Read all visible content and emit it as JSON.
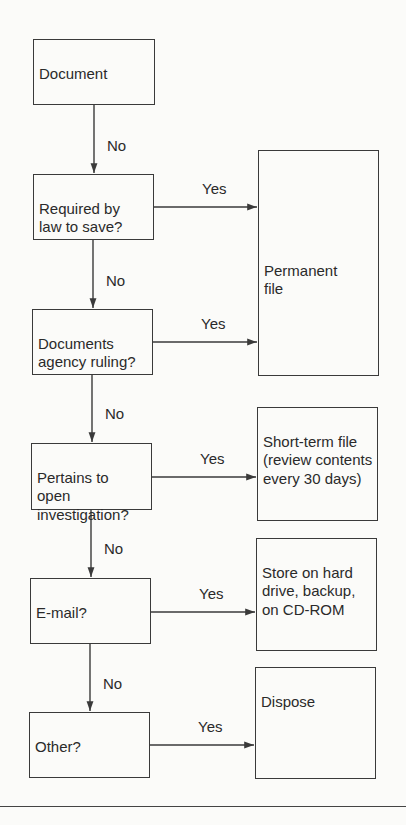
{
  "diagram": {
    "colors": {
      "line": "#3a3a3a",
      "text": "#2a2a2a",
      "background": "#fbfbf9"
    },
    "decisions": [
      {
        "id": "document",
        "label": "Document"
      },
      {
        "id": "required-by-law",
        "label": "Required by\nlaw to save?"
      },
      {
        "id": "agency-ruling",
        "label": "Documents\nagency ruling?"
      },
      {
        "id": "open-investigation",
        "label": "Pertains to\nopen\ninvestigation?"
      },
      {
        "id": "email",
        "label": "E-mail?"
      },
      {
        "id": "other",
        "label": "Other?"
      }
    ],
    "outcomes": [
      {
        "id": "permanent-file",
        "label": "Permanent\nfile"
      },
      {
        "id": "short-term-file",
        "label": "Short-term file\n(review contents\nevery 30 days)"
      },
      {
        "id": "store-digital",
        "label": "Store on hard\ndrive, backup,\non CD-ROM"
      },
      {
        "id": "dispose",
        "label": "Dispose"
      }
    ],
    "edge_labels": {
      "no": "No",
      "yes": "Yes"
    },
    "edges": [
      {
        "from": "document",
        "to": "required-by-law",
        "label": "No"
      },
      {
        "from": "required-by-law",
        "to": "permanent-file",
        "label": "Yes"
      },
      {
        "from": "required-by-law",
        "to": "agency-ruling",
        "label": "No"
      },
      {
        "from": "agency-ruling",
        "to": "permanent-file",
        "label": "Yes"
      },
      {
        "from": "agency-ruling",
        "to": "open-investigation",
        "label": "No"
      },
      {
        "from": "open-investigation",
        "to": "short-term-file",
        "label": "Yes"
      },
      {
        "from": "open-investigation",
        "to": "email",
        "label": "No"
      },
      {
        "from": "email",
        "to": "store-digital",
        "label": "Yes"
      },
      {
        "from": "email",
        "to": "other",
        "label": "No"
      },
      {
        "from": "other",
        "to": "dispose",
        "label": "Yes"
      }
    ]
  }
}
